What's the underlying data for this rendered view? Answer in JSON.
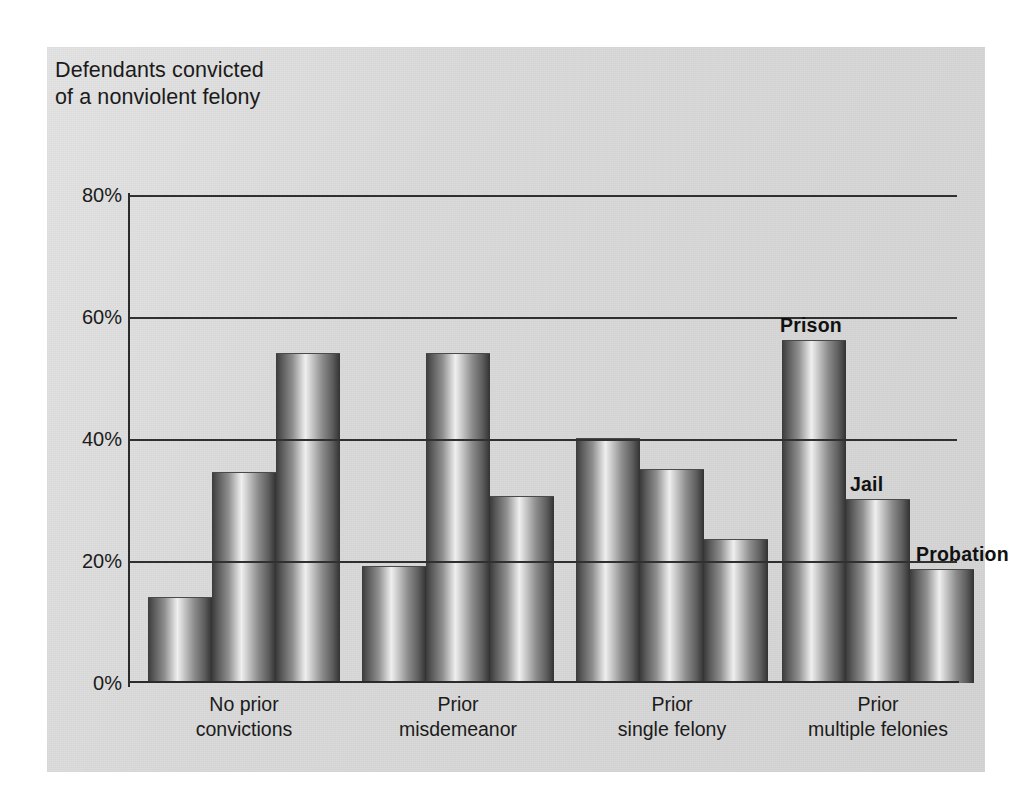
{
  "chart_data": {
    "type": "bar",
    "title": "Defendants convicted\nof a nonviolent felony",
    "xlabel": "",
    "ylabel": "",
    "ylim": [
      0,
      80
    ],
    "ytick_labels": [
      "0%",
      "20%",
      "40%",
      "60%",
      "80%"
    ],
    "ytick_values": [
      0,
      20,
      40,
      60,
      80
    ],
    "grid": "horizontal",
    "legend_position": "inline-callout-on-last-group",
    "categories": [
      "No prior\nconvictions",
      "Prior\nmisdemeanor",
      "Prior\nsingle felony",
      "Prior\nmultiple felonies"
    ],
    "series": [
      {
        "name": "Prison",
        "values": [
          14,
          19,
          40,
          56
        ]
      },
      {
        "name": "Jail",
        "values": [
          34.5,
          54,
          35,
          30
        ]
      },
      {
        "name": "Probation",
        "values": [
          54,
          30.5,
          23.5,
          18.5
        ]
      }
    ],
    "callouts": [
      {
        "label": "Prison",
        "group": "Prior multiple felonies"
      },
      {
        "label": "Jail",
        "group": "Prior multiple felonies"
      },
      {
        "label": "Probation",
        "group": "Prior multiple felonies"
      }
    ],
    "colors": {
      "panel_background": "#d8d9d8",
      "bar_light": "#efefef",
      "bar_dark": "#323232",
      "axis": "#2b2b2b",
      "gridline": "#30302f",
      "text": "#1b1b1b"
    }
  }
}
